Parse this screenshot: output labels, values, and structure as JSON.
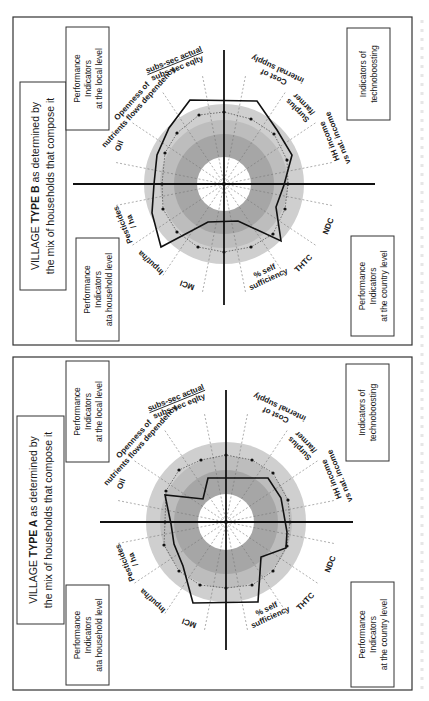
{
  "figure": {
    "caption_visible_fragment": ""
  },
  "panels": [
    {
      "id": "village-type-b",
      "frame": {
        "x": 13,
        "y": 17,
        "w": 399,
        "h": 328
      },
      "center": {
        "x": 224,
        "y": 184
      },
      "title": {
        "prefix": "VILLAGE ",
        "bold": "TYPE B",
        "suffix": " as determined by",
        "line2": "the mix of households that compose it"
      },
      "title_box": {
        "x": 20,
        "y": 82,
        "w": 46,
        "h": 208
      },
      "corner_boxes": [
        {
          "name": "local-level-box",
          "lines": [
            "Performance",
            "Indicators",
            "at the local level"
          ],
          "x": 66,
          "y": 27,
          "w": 43,
          "h": 103
        },
        {
          "name": "household-level-box",
          "lines": [
            "Performance",
            "Indicators",
            "ata household level"
          ],
          "x": 76,
          "y": 238,
          "w": 43,
          "h": 103
        },
        {
          "name": "technoboosting-box",
          "lines": [
            "Indicators of",
            "technoboosting"
          ],
          "x": 347,
          "y": 28,
          "w": 43,
          "h": 92
        },
        {
          "name": "country-level-box",
          "lines": [
            "Performance",
            "Indicators",
            "at the country level"
          ],
          "x": 351,
          "y": 236,
          "w": 43,
          "h": 100
        }
      ],
      "rings": {
        "outer": 80,
        "mid": 64,
        "dark": 50,
        "inner": 27
      },
      "polygon": [
        [
          190,
          100
        ],
        [
          169,
          128
        ],
        [
          157,
          155
        ],
        [
          154,
          184
        ],
        [
          152,
          213
        ],
        [
          161,
          247
        ],
        [
          208,
          222
        ],
        [
          238,
          221
        ],
        [
          281,
          241
        ],
        [
          276,
          207
        ],
        [
          284,
          185
        ],
        [
          292,
          155
        ],
        [
          277,
          130
        ],
        [
          257,
          101
        ]
      ],
      "reference_points": [
        [
          199,
          115
        ],
        [
          177,
          133
        ],
        [
          165,
          153
        ],
        [
          162,
          184
        ],
        [
          163,
          209
        ],
        [
          177,
          232
        ],
        [
          198,
          247
        ],
        [
          224,
          252
        ],
        [
          251,
          247
        ],
        [
          273,
          234
        ],
        [
          285,
          209
        ],
        [
          288,
          184
        ],
        [
          287,
          160
        ],
        [
          274,
          134
        ],
        [
          251,
          119
        ],
        [
          224,
          112
        ]
      ],
      "axis": {
        "h_from": 73,
        "h_to": 375,
        "v_from": 50,
        "v_to": 305
      }
    },
    {
      "id": "village-type-a",
      "frame": {
        "x": 13,
        "y": 357,
        "w": 399,
        "h": 333
      },
      "center": {
        "x": 226,
        "y": 522
      },
      "title": {
        "prefix": "VILLAGE ",
        "bold": "TYPE A",
        "suffix": " as determined by",
        "line2": "the mix of households that compose it"
      },
      "title_box": {
        "x": 17,
        "y": 416,
        "w": 47,
        "h": 208
      },
      "corner_boxes": [
        {
          "name": "local-level-box",
          "lines": [
            "Performance",
            "Indicators",
            "at the local level"
          ],
          "x": 66,
          "y": 361,
          "w": 43,
          "h": 101
        },
        {
          "name": "household-level-box",
          "lines": [
            "Performance",
            "Indicators",
            "ata household level"
          ],
          "x": 66,
          "y": 585,
          "w": 43,
          "h": 100
        },
        {
          "name": "technoboosting-box",
          "lines": [
            "Indicators of",
            "technoboosting"
          ],
          "x": 346,
          "y": 364,
          "w": 43,
          "h": 97
        },
        {
          "name": "country-level-box",
          "lines": [
            "Performance",
            "Indicators",
            "at the country level"
          ],
          "x": 351,
          "y": 582,
          "w": 43,
          "h": 105
        }
      ],
      "rings": {
        "outer": 80,
        "mid": 66,
        "dark": 52,
        "inner": 28
      },
      "polygon": [
        [
          208,
          478
        ],
        [
          203,
          499
        ],
        [
          165,
          495
        ],
        [
          171,
          524
        ],
        [
          174,
          544
        ],
        [
          183,
          566
        ],
        [
          193,
          603
        ],
        [
          258,
          602
        ],
        [
          261,
          557
        ],
        [
          286,
          548
        ],
        [
          287,
          532
        ],
        [
          281,
          498
        ],
        [
          268,
          478
        ]
      ],
      "reference_points": [
        [
          201,
          460
        ],
        [
          179,
          470
        ],
        [
          166,
          491
        ],
        [
          165,
          522
        ],
        [
          164,
          545
        ],
        [
          179,
          571
        ],
        [
          200,
          585
        ],
        [
          226,
          588
        ],
        [
          252,
          585
        ],
        [
          273,
          571
        ],
        [
          287,
          546
        ],
        [
          290,
          522
        ],
        [
          288,
          500
        ],
        [
          273,
          473
        ],
        [
          252,
          460
        ],
        [
          226,
          455
        ]
      ],
      "axis": {
        "h_from": 100,
        "h_to": 353,
        "v_from": 390,
        "v_to": 650
      }
    }
  ],
  "axis_labels": [
    {
      "name": "pesticides-label",
      "lines": [
        "Pesticides",
        "/ ha"
      ],
      "angle_deg": -112,
      "r": 105
    },
    {
      "name": "input-ha-label",
      "lines": [
        "Input/ha"
      ],
      "angle_deg": -137,
      "r": 108
    },
    {
      "name": "mci-label",
      "lines": [
        "MCI"
      ],
      "angle_deg": -160,
      "r": 108
    },
    {
      "name": "self-sufficiency-label",
      "lines": [
        "% self",
        "sufficiency"
      ],
      "angle_deg": 155,
      "r": 100
    },
    {
      "name": "thtc-label",
      "lines": [
        "THTC"
      ],
      "angle_deg": 135,
      "r": 112
    },
    {
      "name": "ndc-label",
      "lines": [
        "NDC"
      ],
      "angle_deg": 112,
      "r": 112
    },
    {
      "name": "hh-income-label",
      "lines": [
        "HH income",
        "vs nat. income"
      ],
      "angle_deg": 68,
      "r": 118
    },
    {
      "name": "surplus-farmer-label",
      "lines": [
        "Surplus",
        "/farmer"
      ],
      "angle_deg": 45,
      "r": 108
    },
    {
      "name": "cost-internal-supply-label",
      "lines": [
        "Cost of",
        "internal supply"
      ],
      "angle_deg": 25,
      "r": 122
    },
    {
      "name": "subs-sec-label",
      "lines": [
        "subs-sec actual",
        "subs-sec eqlty"
      ],
      "angle_deg": -22,
      "r": 130,
      "fraction": true
    },
    {
      "name": "openness-label",
      "lines": [
        "Openness of",
        "nutrients flows dependency"
      ],
      "angle_deg": -48,
      "r": 120
    },
    {
      "name": "oil-label",
      "lines": [
        "Oil"
      ],
      "angle_deg": -70,
      "r": 112
    }
  ],
  "colors": {
    "outer_ring": "#cfcfcf",
    "mid_ring": "#bdbdbd",
    "dark_ring": "#a6a6a6",
    "inner_disc": "#ffffff",
    "polygon": "#111111",
    "spokes": "#777777",
    "frame": "#333333"
  },
  "chart_data": {
    "type": "radar",
    "note": "Two radar (spider) diagrams of performance indicators; values estimated as relative radius (reference dotted ring = 1.0).",
    "axes": [
      "Pesticides / ha",
      "Input/ha",
      "MCI",
      "% self sufficiency",
      "THTC",
      "NDC",
      "HH income vs nat. income",
      "Surplus /farmer",
      "Cost of internal supply",
      "subs-sec actual / subs-sec eqlty",
      "Openness of nutrients flows dependency",
      "Oil"
    ],
    "series": [
      {
        "name": "Village Type A",
        "values": [
          0.6,
          0.6,
          1.1,
          0.9,
          1.15,
          1.2,
          1.2,
          0.7,
          1.1,
          0.95,
          1.0,
          0.55
        ]
      },
      {
        "name": "Village Type B",
        "values": [
          1.3,
          1.2,
          1.05,
          1.1,
          1.3,
          0.6,
          0.6,
          1.3,
          0.8,
          1.2,
          1.2,
          1.3
        ]
      }
    ],
    "quadrant_groups": [
      "Performance Indicators at the local level",
      "Performance Indicators ata household level",
      "Indicators of technoboosting",
      "Performance Indicators at the country level"
    ]
  }
}
